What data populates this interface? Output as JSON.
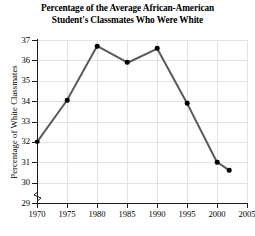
{
  "chart_data": {
    "type": "line",
    "title": "Percentage of the Average African-American Student's Classmates Who Were White",
    "title_line1": "Percentage of the Average African-American",
    "title_line2": "Student's Classmates Who Were White",
    "xlabel": "",
    "ylabel": "Percentage of White Classmates",
    "x": [
      1970,
      1975,
      1980,
      1985,
      1990,
      1995,
      2000,
      2002
    ],
    "values": [
      32.0,
      34.05,
      36.7,
      35.9,
      36.6,
      33.9,
      31.0,
      30.6
    ],
    "series": [
      {
        "name": "Percentage of White Classmates",
        "x": [
          1970,
          1975,
          1980,
          1985,
          1990,
          1995,
          2000,
          2002
        ],
        "values": [
          32.0,
          34.05,
          36.7,
          35.9,
          36.6,
          33.9,
          31.0,
          30.6
        ]
      }
    ],
    "xlim": [
      1970,
      2005
    ],
    "ylim": [
      29,
      37
    ],
    "y_axis_break": true,
    "grid": true,
    "legend": "none",
    "line_color": "#5a5a5a",
    "marker_color": "#000000",
    "grid_color": "#e3e3e3",
    "axis_color": "#1a1a1a",
    "xticks": [
      1970,
      1975,
      1980,
      1985,
      1990,
      1995,
      2000,
      2005
    ],
    "xticklabels": [
      "1970",
      "1975",
      "1980",
      "1985",
      "1990",
      "1995",
      "2000",
      "2005"
    ],
    "yticks": [
      29,
      30,
      31,
      32,
      33,
      34,
      35,
      36,
      37
    ],
    "yticklabels": [
      "29",
      "30",
      "31",
      "32",
      "33",
      "34",
      "35",
      "36",
      "37"
    ]
  }
}
